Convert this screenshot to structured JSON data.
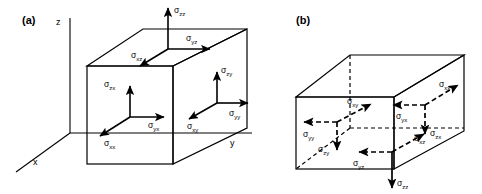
{
  "figure": {
    "background": "#ffffff",
    "ink": "#000000",
    "panels": [
      {
        "id": "a",
        "label": "(a)",
        "face_set": "visible faces",
        "axes": [
          {
            "name": "z-axis",
            "label": "z",
            "direction": "up"
          },
          {
            "name": "x-axis",
            "label": "x",
            "direction": "down-left"
          },
          {
            "name": "y-axis",
            "label": "y",
            "direction": "right"
          }
        ],
        "components": [
          {
            "symbol": "σ",
            "sub": "zz",
            "face": "top",
            "direction": "up",
            "style": "solid"
          },
          {
            "symbol": "σ",
            "sub": "yz",
            "face": "top",
            "direction": "right",
            "style": "solid"
          },
          {
            "symbol": "σ",
            "sub": "xz",
            "face": "top",
            "direction": "down-left",
            "style": "solid"
          },
          {
            "symbol": "σ",
            "sub": "zx",
            "face": "front",
            "direction": "up",
            "style": "solid"
          },
          {
            "symbol": "σ",
            "sub": "yx",
            "face": "front",
            "direction": "right",
            "style": "solid"
          },
          {
            "symbol": "σ",
            "sub": "xx",
            "face": "front",
            "direction": "down-left",
            "style": "solid"
          },
          {
            "symbol": "σ",
            "sub": "zy",
            "face": "right",
            "direction": "up",
            "style": "solid"
          },
          {
            "symbol": "σ",
            "sub": "yy",
            "face": "right",
            "direction": "right",
            "style": "solid"
          },
          {
            "symbol": "σ",
            "sub": "xy",
            "face": "right",
            "direction": "down-left",
            "style": "solid"
          }
        ]
      },
      {
        "id": "b",
        "label": "(b)",
        "face_set": "hidden faces",
        "axes": [],
        "components": [
          {
            "symbol": "σ",
            "sub": "xy",
            "face": "rear-left",
            "direction": "up-right",
            "style": "dashed"
          },
          {
            "symbol": "σ",
            "sub": "yy",
            "face": "rear-left",
            "direction": "left",
            "style": "dashed"
          },
          {
            "symbol": "σ",
            "sub": "zy",
            "face": "rear-left",
            "direction": "down",
            "style": "dashed"
          },
          {
            "symbol": "σ",
            "sub": "xx",
            "face": "rear-right",
            "direction": "up-right",
            "style": "dashed"
          },
          {
            "symbol": "σ",
            "sub": "yx",
            "face": "rear-right",
            "direction": "left",
            "style": "dashed"
          },
          {
            "symbol": "σ",
            "sub": "zx",
            "face": "rear-right",
            "direction": "down",
            "style": "dashed"
          },
          {
            "symbol": "σ",
            "sub": "xz",
            "face": "bottom",
            "direction": "up-right",
            "style": "dashed"
          },
          {
            "symbol": "σ",
            "sub": "yz",
            "face": "bottom",
            "direction": "left",
            "style": "dashed"
          },
          {
            "symbol": "σ",
            "sub": "zz",
            "face": "bottom",
            "direction": "down",
            "style": "solid"
          }
        ]
      }
    ]
  },
  "labels": {
    "panel_a": "(a)",
    "panel_b": "(b)",
    "axis_z": "z",
    "axis_x": "x",
    "axis_y": "y",
    "sigma": "σ",
    "sub_zz": "zz",
    "sub_yz": "yz",
    "sub_xz": "xz",
    "sub_zx": "zx",
    "sub_yx": "yx",
    "sub_xx": "xx",
    "sub_zy": "zy",
    "sub_yy": "yy",
    "sub_xy": "xy"
  }
}
